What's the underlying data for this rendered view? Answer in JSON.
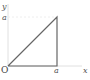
{
  "diagram": {
    "type": "right-triangle-on-axes",
    "axes": {
      "x_label": "x",
      "y_label": "y",
      "origin_label": "O"
    },
    "tick_labels": {
      "x_tick": "a",
      "y_tick": "a"
    },
    "vertices": [
      {
        "name": "O",
        "x": 0,
        "y": 0
      },
      {
        "name": "A",
        "x": "a",
        "y": 0
      },
      {
        "name": "B",
        "x": "a",
        "y": "a"
      }
    ],
    "colors": {
      "triangle": "#666666",
      "axis": "#e0e0e0",
      "guide": "#e6e6e6",
      "text": "#555555"
    }
  }
}
